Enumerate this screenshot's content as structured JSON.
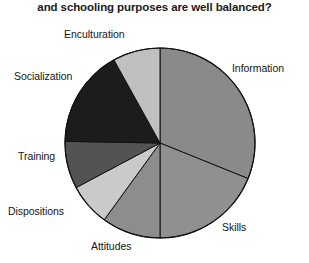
{
  "chart": {
    "title": "and schooling purposes are well balanced?"
  },
  "chart_data": {
    "type": "pie",
    "title": "and schooling purposes are well balanced?",
    "xlabel": "",
    "ylabel": "",
    "legend_position": "none",
    "grid": false,
    "labels_position": "outside",
    "categories": [
      "Information",
      "Skills",
      "Attitudes",
      "Dispositions",
      "Training",
      "Socialization",
      "Enculturation"
    ],
    "values": [
      31,
      19,
      10,
      7,
      8,
      17,
      8
    ],
    "start_angle_deg": 0,
    "direction": "clockwise",
    "slices": [
      {
        "label": "Information",
        "value": 31,
        "start_deg": 0,
        "end_deg": 112,
        "color": "#8a8a8a"
      },
      {
        "label": "Skills",
        "value": 19,
        "start_deg": 112,
        "end_deg": 180,
        "color": "#909090"
      },
      {
        "label": "Attitudes",
        "value": 10,
        "start_deg": 180,
        "end_deg": 216,
        "color": "#8d8d8d"
      },
      {
        "label": "Dispositions",
        "value": 7,
        "start_deg": 216,
        "end_deg": 242,
        "color": "#cacaca"
      },
      {
        "label": "Training",
        "value": 8,
        "start_deg": 242,
        "end_deg": 271,
        "color": "#535353"
      },
      {
        "label": "Socialization",
        "value": 17,
        "start_deg": 271,
        "end_deg": 331,
        "color": "#1c1c1c"
      },
      {
        "label": "Enculturation",
        "value": 8,
        "start_deg": 331,
        "end_deg": 360,
        "color": "#c0c0c0"
      }
    ],
    "geometry": {
      "center_x": 160,
      "center_y": 143,
      "radius": 95
    }
  },
  "labels": {
    "enculturation": "Enculturation",
    "information": "Information",
    "socialization": "Socialization",
    "training": "Training",
    "dispositions": "Dispositions",
    "attitudes": "Attitudes",
    "skills": "Skills"
  },
  "colors": {
    "information": "#8a8a8a",
    "skills": "#909090",
    "attitudes": "#8d8d8d",
    "dispositions": "#cacaca",
    "training": "#535353",
    "socialization": "#1c1c1c",
    "enculturation": "#c0c0c0",
    "outline": "#111111",
    "text": "#161616",
    "background": "#ffffff"
  }
}
